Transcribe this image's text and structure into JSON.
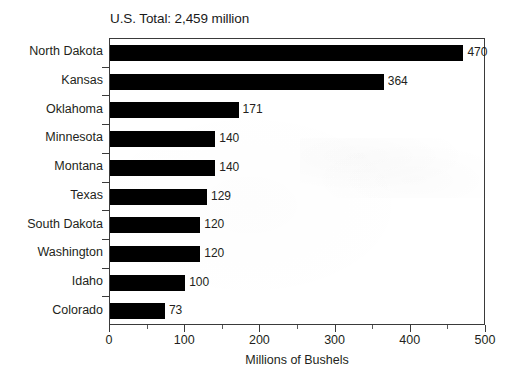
{
  "chart_data": {
    "type": "bar",
    "orientation": "horizontal",
    "title": "U.S. Total: 2,459 million",
    "xlabel": "Millions of Bushels",
    "ylabel": "",
    "xlim": [
      0,
      500
    ],
    "xticks": [
      0,
      100,
      200,
      300,
      400,
      500
    ],
    "xtick_labels": [
      "0",
      "100",
      "200",
      "300",
      "400",
      "500"
    ],
    "minor_tick_interval": 50,
    "grid": false,
    "legend": null,
    "bar_color": "#000000",
    "categories": [
      "North Dakota",
      "Kansas",
      "Oklahoma",
      "Minnesota",
      "Montana",
      "Texas",
      "South Dakota",
      "Washington",
      "Idaho",
      "Colorado"
    ],
    "values": [
      470,
      364,
      171,
      140,
      140,
      129,
      120,
      120,
      100,
      73
    ],
    "value_labels": [
      "470",
      "364",
      "171",
      "140",
      "140",
      "129",
      "120",
      "120",
      "100",
      "73"
    ]
  }
}
